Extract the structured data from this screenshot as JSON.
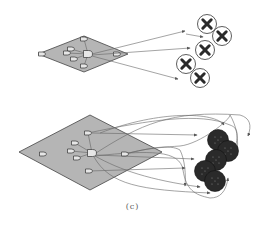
{
  "figure": {
    "caption": "(c)",
    "colors": {
      "plane_fill": "#b5b5b5",
      "plane_stroke": "#444444",
      "arrow": "#666666",
      "node_stroke": "#333333",
      "dark_node": "#2a2a2a",
      "x_mark": "#2a2a2a"
    },
    "top_panel": {
      "plane": {
        "left": [
          38,
          54
        ],
        "top": [
          84,
          36
        ],
        "right": [
          128,
          54
        ],
        "bottom": [
          84,
          72
        ]
      },
      "gates": [
        {
          "x": 84,
          "y": 39
        },
        {
          "x": 42,
          "y": 54
        },
        {
          "x": 71,
          "y": 49
        },
        {
          "x": 67,
          "y": 53
        },
        {
          "x": 74,
          "y": 59
        },
        {
          "x": 84,
          "y": 66
        },
        {
          "x": 117,
          "y": 54
        }
      ],
      "hub": {
        "x": 88,
        "y": 54
      },
      "targets": [
        {
          "x": 207,
          "y": 24,
          "type": "x-circle"
        },
        {
          "x": 222,
          "y": 36,
          "type": "x-circle"
        },
        {
          "x": 205,
          "y": 50,
          "type": "x-circle"
        },
        {
          "x": 186,
          "y": 64,
          "type": "x-circle"
        },
        {
          "x": 200,
          "y": 78,
          "type": "x-circle"
        }
      ]
    },
    "bottom_panel": {
      "plane": {
        "left": [
          19,
          152
        ],
        "top": [
          90,
          115
        ],
        "right": [
          162,
          152
        ],
        "bottom": [
          90,
          190
        ]
      },
      "gates": [
        {
          "x": 88,
          "y": 133
        },
        {
          "x": 43,
          "y": 154
        },
        {
          "x": 75,
          "y": 143
        },
        {
          "x": 71,
          "y": 151
        },
        {
          "x": 77,
          "y": 158
        },
        {
          "x": 89,
          "y": 171
        },
        {
          "x": 125,
          "y": 154
        }
      ],
      "hub": {
        "x": 92,
        "y": 153
      },
      "targets": [
        {
          "x": 218,
          "y": 140,
          "type": "dark-circle"
        },
        {
          "x": 228,
          "y": 151,
          "type": "dark-circle"
        },
        {
          "x": 216,
          "y": 160,
          "type": "dark-circle"
        },
        {
          "x": 205,
          "y": 171,
          "type": "dark-circle"
        },
        {
          "x": 215,
          "y": 181,
          "type": "dark-circle"
        }
      ]
    }
  }
}
